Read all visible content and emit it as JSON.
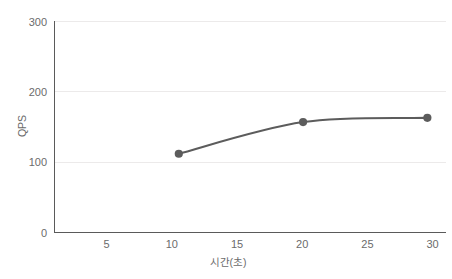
{
  "chart_data": {
    "type": "line",
    "title": "",
    "xlabel": "시간(초)",
    "ylabel": "QPS",
    "x": [
      10,
      20,
      30
    ],
    "values": [
      112,
      157,
      163
    ],
    "series": [
      {
        "name": "QPS",
        "x": [
          10,
          20,
          30
        ],
        "values": [
          112,
          157,
          163
        ],
        "color": "#5c5c5c",
        "marker": "circle",
        "smooth": true
      }
    ],
    "xlim": [
      0,
      31.5
    ],
    "ylim": [
      0,
      300
    ],
    "xticks": [
      5,
      10,
      15,
      20,
      25,
      30
    ],
    "xtick_labels": [
      "5",
      "10",
      "15",
      "20",
      "25",
      "30"
    ],
    "yticks": [
      0,
      100,
      200,
      300
    ],
    "ytick_labels": [
      "0",
      "100",
      "200",
      "300"
    ],
    "grid": "horizontal",
    "grid_color": "#eceaea",
    "axis_color": "#5a5a5a",
    "legend": "none",
    "background": "#ffffff"
  },
  "axes": {
    "y_title": "QPS",
    "x_title": "시간(초)",
    "y_ticks": [
      {
        "label": "300",
        "value": 300
      },
      {
        "label": "200",
        "value": 200
      },
      {
        "label": "100",
        "value": 100
      },
      {
        "label": "0",
        "value": 0
      }
    ],
    "x_ticks": [
      {
        "label": "5",
        "value": 5
      },
      {
        "label": "10",
        "value": 10
      },
      {
        "label": "15",
        "value": 15
      },
      {
        "label": "20",
        "value": 20
      },
      {
        "label": "25",
        "value": 25
      },
      {
        "label": "30",
        "value": 30
      }
    ]
  },
  "points": [
    {
      "label": "10",
      "x": 10,
      "y": 112
    },
    {
      "label": "20",
      "x": 20,
      "y": 157
    },
    {
      "label": "30",
      "x": 30,
      "y": 163
    }
  ]
}
